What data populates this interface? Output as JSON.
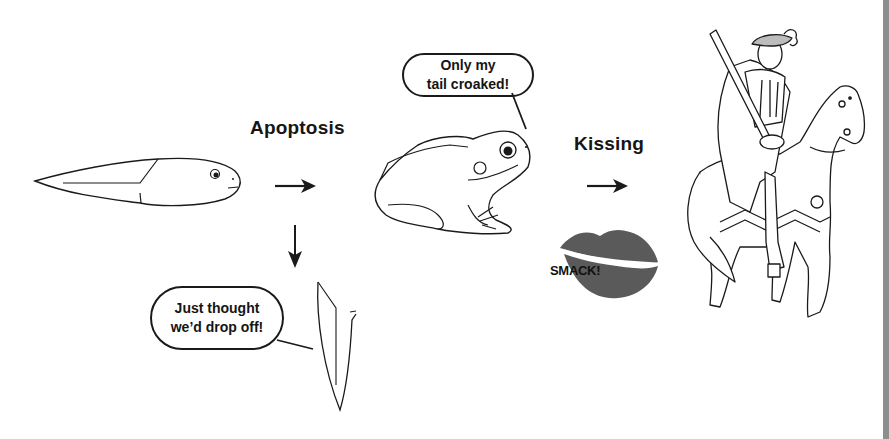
{
  "figure": {
    "stages": [
      {
        "id": "tadpole",
        "description": "tadpole"
      },
      {
        "id": "frog",
        "description": "frog"
      },
      {
        "id": "prince",
        "description": "knight on horseback"
      }
    ],
    "labels": {
      "apoptosis": "Apoptosis",
      "kissing": "Kissing",
      "smack": "SMACK!"
    },
    "speech_bubbles": {
      "frog": {
        "line1": "Only my",
        "line2": "tail croaked!"
      },
      "tail": {
        "line1": "Just thought",
        "line2": "we’d drop off!"
      }
    },
    "arrows": [
      {
        "from": "tadpole",
        "to": "frog",
        "direction": "right"
      },
      {
        "from": "tadpole",
        "to": "tail",
        "direction": "down"
      },
      {
        "from": "frog",
        "to": "prince",
        "direction": "right"
      }
    ],
    "colors": {
      "line": "#1a1a1a",
      "lips": "#5a5a5a",
      "edge_bar": "#8e8e8e",
      "background": "#ffffff"
    }
  }
}
